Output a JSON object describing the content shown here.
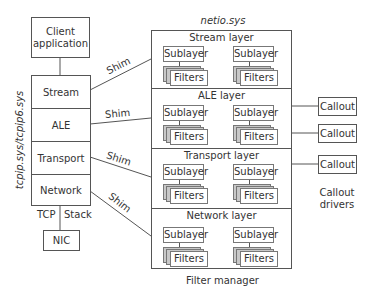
{
  "client_app": {
    "label_line1": "Client",
    "label_line2": "application"
  },
  "tcpip_stack": {
    "side_label": "tcpip.sys/tcpip6.sys",
    "layers": [
      "Stream",
      "ALE",
      "Transport",
      "Network"
    ],
    "bottom_left_label": "TCP",
    "bottom_right_label": "Stack"
  },
  "nic": {
    "label": "NIC"
  },
  "shims": [
    "Shim",
    "Shim",
    "Shim",
    "Shim"
  ],
  "netio": {
    "title": "netio.sys",
    "caption": "Filter manager",
    "layers": [
      {
        "title": "Stream layer",
        "sublayer": "Sublayer",
        "filters": "Filters"
      },
      {
        "title": "ALE layer",
        "sublayer": "Sublayer",
        "filters": "Filters"
      },
      {
        "title": "Transport layer",
        "sublayer": "Sublayer",
        "filters": "Filters"
      },
      {
        "title": "Network layer",
        "sublayer": "Sublayer",
        "filters": "Filters"
      }
    ]
  },
  "callouts": {
    "boxes": [
      "Callout",
      "Callout",
      "Callout"
    ],
    "caption_line1": "Callout",
    "caption_line2": "drivers"
  },
  "colors": {
    "line": "#555555",
    "text": "#333333",
    "stack_shadow": "#c8c8c8"
  }
}
